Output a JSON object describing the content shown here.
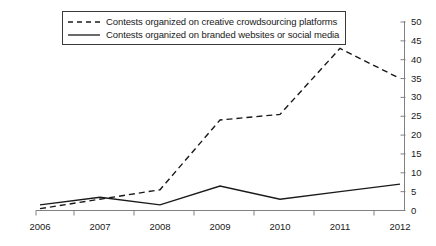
{
  "chart_data": {
    "type": "line",
    "title": "",
    "xlabel": "",
    "ylabel": "",
    "categories": [
      "2006",
      "2007",
      "2008",
      "2009",
      "2010",
      "2011",
      "2012"
    ],
    "ylim": [
      0,
      50
    ],
    "yticks": [
      0,
      5,
      10,
      15,
      20,
      25,
      30,
      35,
      40,
      45,
      50
    ],
    "grid": false,
    "legend_position": "top-left",
    "axis_color": "#808080",
    "series": [
      {
        "name": "Contests organized on creative crowdsourcing platforms",
        "style": "dashed",
        "color": "#1a1a1a",
        "values": [
          0.5,
          3,
          5.5,
          24,
          25.5,
          43,
          35
        ]
      },
      {
        "name": "Contests organized on branded websites or social media",
        "style": "solid",
        "color": "#1a1a1a",
        "values": [
          1.5,
          3.5,
          1.5,
          6.5,
          3,
          5,
          7
        ]
      }
    ]
  },
  "legend": {
    "items": [
      {
        "label": "Contests organized on creative crowdsourcing platforms",
        "sample": "dashed-line-sample"
      },
      {
        "label": "Contests organized on branded websites or social media",
        "sample": "solid-line-sample"
      }
    ]
  },
  "axes": {
    "y_tick_labels": [
      "0",
      "5",
      "10",
      "15",
      "20",
      "25",
      "30",
      "35",
      "40",
      "45",
      "50"
    ],
    "x_tick_labels": [
      "2006",
      "2007",
      "2008",
      "2009",
      "2010",
      "2011",
      "2012"
    ]
  }
}
